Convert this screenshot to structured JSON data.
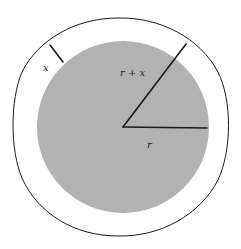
{
  "diagram": {
    "type": "concentric-circles",
    "colors": {
      "background": "#ffffff",
      "inner_disk_fill": "#b2b2b2",
      "outline": "#1a1a1a"
    },
    "outer_circle": {
      "cx": 121,
      "cy": 127,
      "r": 109
    },
    "inner_disk": {
      "cx": 123,
      "cy": 127,
      "r": 86
    },
    "center": {
      "x": 123,
      "y": 127
    },
    "segments": [
      {
        "id": "radius-r",
        "x1": 123,
        "y1": 127,
        "x2": 207,
        "y2": 128
      },
      {
        "id": "radius-r-plus-x",
        "x1": 123,
        "y1": 127,
        "x2": 186,
        "y2": 44
      },
      {
        "id": "gap-x",
        "x1": 50,
        "y1": 45,
        "x2": 63,
        "y2": 62
      }
    ],
    "labels": {
      "r": "r",
      "r_plus_x": "r + x",
      "x": "x"
    }
  }
}
